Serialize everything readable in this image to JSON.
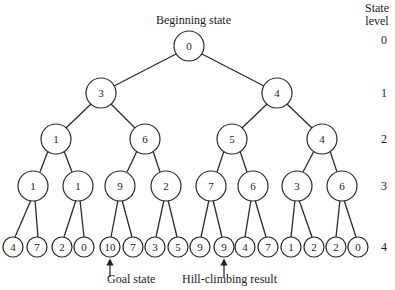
{
  "title": "Beginning state",
  "state_level_header": [
    "State",
    "level"
  ],
  "levels": [
    "0",
    "1",
    "2",
    "3",
    "4"
  ],
  "annotations": {
    "goal": "Goal state",
    "hill": "Hill-climbing result"
  },
  "tree": {
    "level0": [
      "0"
    ],
    "level1": [
      "3",
      "4"
    ],
    "level2": [
      "1",
      "6",
      "5",
      "4"
    ],
    "level3": [
      "1",
      "1",
      "9",
      "2",
      "7",
      "6",
      "3",
      "6"
    ],
    "level4": [
      "4",
      "7",
      "2",
      "0",
      "10",
      "7",
      "3",
      "5",
      "9",
      "9",
      "4",
      "7",
      "1",
      "2",
      "2",
      "0"
    ]
  }
}
